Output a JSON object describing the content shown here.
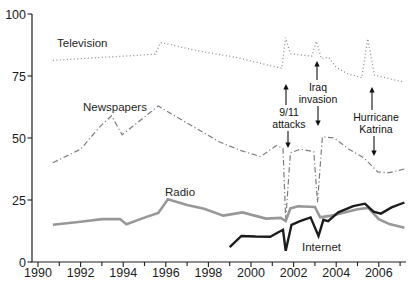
{
  "figure": {
    "width": 410,
    "height": 295,
    "background": "#ffffff",
    "axis_color": "#1f1f1f"
  },
  "chart_data": {
    "type": "line",
    "title": "",
    "xlabel": "",
    "ylabel": "",
    "x_range": [
      1990,
      2007.2
    ],
    "y_range": [
      0,
      100
    ],
    "grid": "off",
    "legend_position": "inline-labels",
    "y_ticks": [
      0,
      25,
      50,
      75,
      100
    ],
    "y_tick_labels": [
      "0",
      "25",
      "50",
      "75",
      "100"
    ],
    "x_tick_years": [
      1990,
      1991,
      1992,
      1993,
      1994,
      1995,
      1996,
      1997,
      1998,
      1999,
      2000,
      2001,
      2002,
      2003,
      2004,
      2005,
      2006,
      2007
    ],
    "x_labeled_years": [
      1990,
      1992,
      1994,
      1996,
      1998,
      2000,
      2002,
      2004,
      2006
    ],
    "x_tick_labels": [
      "1990",
      "1992",
      "1994",
      "1996",
      "1998",
      "2000",
      "2002",
      "2004",
      "2006"
    ],
    "series": [
      {
        "name": "Television",
        "style": "dotted",
        "color": "#8f8f8f",
        "width": 1.3,
        "points": [
          [
            1990.7,
            81.3
          ],
          [
            1992,
            82
          ],
          [
            1993,
            82.5
          ],
          [
            1994,
            83
          ],
          [
            1995.5,
            83.8
          ],
          [
            1995.75,
            88.5
          ],
          [
            1996.3,
            87.5
          ],
          [
            1997.3,
            85.5
          ],
          [
            1998.3,
            84
          ],
          [
            1999.3,
            82.5
          ],
          [
            2000.2,
            80.6
          ],
          [
            2001.0,
            79
          ],
          [
            2001.45,
            78.2
          ],
          [
            2001.62,
            90.5
          ],
          [
            2001.85,
            84
          ],
          [
            2002.3,
            83.5
          ],
          [
            2002.85,
            83
          ],
          [
            2003.07,
            89
          ],
          [
            2003.3,
            82
          ],
          [
            2003.65,
            82.5
          ],
          [
            2004.0,
            78.5
          ],
          [
            2004.5,
            76
          ],
          [
            2005.2,
            74.3
          ],
          [
            2005.48,
            90
          ],
          [
            2005.8,
            75.3
          ],
          [
            2006.3,
            74.3
          ],
          [
            2007.2,
            72.5
          ]
        ]
      },
      {
        "name": "Newspapers",
        "style": "dashdot",
        "color": "#7d7d7d",
        "width": 1.2,
        "points": [
          [
            1990.7,
            40
          ],
          [
            1992,
            45.5
          ],
          [
            1992.9,
            54.5
          ],
          [
            1993.45,
            59
          ],
          [
            1993.95,
            51.3
          ],
          [
            1995.65,
            62.9
          ],
          [
            1996.5,
            58.5
          ],
          [
            1997.5,
            53.5
          ],
          [
            1998.5,
            48.5
          ],
          [
            1999.5,
            45
          ],
          [
            2000.45,
            42.5
          ],
          [
            2001.2,
            47
          ],
          [
            2001.5,
            45.8
          ],
          [
            2001.63,
            17
          ],
          [
            2001.85,
            44
          ],
          [
            2002.3,
            45.5
          ],
          [
            2002.95,
            44.5
          ],
          [
            2003.12,
            24
          ],
          [
            2003.35,
            50.5
          ],
          [
            2003.9,
            50
          ],
          [
            2004.6,
            45.5
          ],
          [
            2005.3,
            42
          ],
          [
            2005.65,
            39
          ],
          [
            2005.95,
            36.3
          ],
          [
            2006.5,
            36
          ],
          [
            2007.2,
            37.5
          ]
        ]
      },
      {
        "name": "Radio",
        "style": "solid",
        "color": "#989898",
        "width": 2.6,
        "points": [
          [
            1990.7,
            15
          ],
          [
            1992,
            16.2
          ],
          [
            1993,
            17.3
          ],
          [
            1993.85,
            17.3
          ],
          [
            1994.15,
            15.2
          ],
          [
            1995.1,
            18.2
          ],
          [
            1995.65,
            19.8
          ],
          [
            1996.1,
            25.3
          ],
          [
            1997,
            23
          ],
          [
            1997.8,
            21.5
          ],
          [
            1998.7,
            18.7
          ],
          [
            1999.6,
            20
          ],
          [
            2000.7,
            17.5
          ],
          [
            2001.4,
            17.8
          ],
          [
            2001.63,
            16.5
          ],
          [
            2001.85,
            21.6
          ],
          [
            2002.2,
            22.5
          ],
          [
            2003.0,
            22.2
          ],
          [
            2003.25,
            18
          ],
          [
            2003.7,
            18.6
          ],
          [
            2004.2,
            19.5
          ],
          [
            2005.0,
            21.3
          ],
          [
            2005.5,
            21.8
          ],
          [
            2006.0,
            17.3
          ],
          [
            2006.5,
            15.3
          ],
          [
            2007.2,
            13.8
          ]
        ]
      },
      {
        "name": "Internet",
        "style": "solid",
        "color": "#1c1c1c",
        "width": 2.4,
        "points": [
          [
            1999.0,
            6
          ],
          [
            1999.55,
            10.5
          ],
          [
            2000.2,
            10.3
          ],
          [
            2000.9,
            10.2
          ],
          [
            2001.35,
            12.3
          ],
          [
            2001.5,
            13
          ],
          [
            2001.63,
            4.5
          ],
          [
            2001.9,
            15
          ],
          [
            2002.3,
            16.5
          ],
          [
            2002.8,
            18
          ],
          [
            2003.17,
            10.5
          ],
          [
            2003.4,
            17
          ],
          [
            2003.62,
            16.5
          ],
          [
            2004.1,
            20
          ],
          [
            2004.8,
            22.5
          ],
          [
            2005.35,
            23.5
          ],
          [
            2005.75,
            20.3
          ],
          [
            2006.1,
            19.5
          ],
          [
            2006.6,
            22
          ],
          [
            2007.2,
            24
          ]
        ]
      }
    ],
    "series_labels": [
      {
        "text": "Television",
        "x": 57,
        "y": 47
      },
      {
        "text": "Newspapers",
        "x": 83,
        "y": 111
      },
      {
        "text": "Radio",
        "x": 165,
        "y": 196
      },
      {
        "text": "Internet",
        "x": 302,
        "y": 251
      }
    ],
    "annotations": [
      {
        "id": "annotation-911",
        "lines": [
          "9/11",
          "attacks"
        ],
        "cx": 289,
        "text_top": 107,
        "up_arrow": {
          "x": 286,
          "from": 105,
          "to": 84
        },
        "down_arrow": {
          "x": 288,
          "from": 131,
          "to": 148
        }
      },
      {
        "id": "annotation-iraq",
        "lines": [
          "Iraq",
          "invasion"
        ],
        "cx": 318,
        "text_top": 82,
        "up_arrow": {
          "x": 317,
          "from": 80,
          "to": 61
        },
        "down_arrow": {
          "x": 318,
          "from": 106,
          "to": 126
        }
      },
      {
        "id": "annotation-katrina",
        "lines": [
          "Hurricane",
          "Katrina"
        ],
        "cx": 376,
        "text_top": 112,
        "up_arrow": {
          "x": 372,
          "from": 110,
          "to": 87
        },
        "down_arrow": {
          "x": 374,
          "from": 136,
          "to": 156
        }
      }
    ]
  }
}
